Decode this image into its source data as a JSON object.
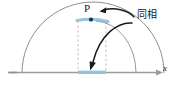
{
  "figure": {
    "title_label": "",
    "labels": {
      "point_p": "P",
      "phase_annotation": "同相",
      "axis_x": "x"
    },
    "colors": {
      "arc": "#8a8a8a",
      "axis": "#9a9a9a",
      "highlight": "#8fc4e0",
      "dashed": "#c6a9a9",
      "arrow": "#1a1a1a",
      "point": "#2a3440",
      "background": "#ffffff"
    },
    "geometry": {
      "axis_y": 73,
      "axis_x_start": 8,
      "axis_x_end": 160,
      "arc_center_x": 93,
      "arc_radius": 71,
      "point_p_x": 91,
      "point_p_y": 19,
      "dashed_left_x": 78,
      "dashed_right_x": 106,
      "highlight_arc_x1": 78,
      "highlight_arc_x2": 106,
      "highlight_axis_x1": 78,
      "highlight_axis_x2": 106
    },
    "icons": {
      "arrow_to_point": "curved-arrow-icon",
      "arrow_to_axis": "curved-arrow-icon",
      "axis_arrowhead": "arrowhead-icon",
      "point_marker": "point-marker-icon"
    }
  }
}
